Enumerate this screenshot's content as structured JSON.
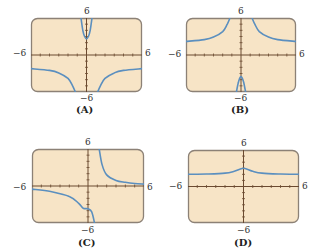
{
  "colors": {
    "panel_fill": "#f7e4c6",
    "panel_border": "#8c8176",
    "axis": "#6b4a30",
    "curve": "#5b8fbf"
  },
  "chart_data": [
    {
      "type": "line",
      "title": "(A)",
      "xlim": [
        -6,
        6
      ],
      "ylim": [
        -6,
        6
      ],
      "tick_labels": {
        "x_left": "-6",
        "x_right": "6",
        "y_top": "6",
        "y_bottom": "-6"
      },
      "description": "Vertical asymptotes near x=±1; middle branch opens upward with minimum near y≈2.5; outer branches approach y≈-2 from below and drop to -6 near asymptotes",
      "series": [
        {
          "name": "left-branch",
          "x": [
            -6,
            -4,
            -3,
            -2,
            -1.5,
            -1.2
          ],
          "y": [
            -2.2,
            -2.5,
            -2.9,
            -3.8,
            -5,
            -6
          ]
        },
        {
          "name": "middle-branch",
          "x": [
            -0.6,
            -0.4,
            -0.2,
            0,
            0.2,
            0.4,
            0.6
          ],
          "y": [
            6,
            4,
            3,
            2.6,
            3,
            4,
            6
          ]
        },
        {
          "name": "right-branch",
          "x": [
            1.2,
            1.5,
            2,
            3,
            4,
            6
          ],
          "y": [
            -6,
            -5,
            -3.8,
            -2.9,
            -2.5,
            -2.2
          ]
        }
      ]
    },
    {
      "type": "line",
      "title": "(B)",
      "xlim": [
        -6,
        6
      ],
      "ylim": [
        -6,
        6
      ],
      "tick_labels": {
        "x_left": "-6",
        "x_right": "6",
        "y_top": "6",
        "y_bottom": "-6"
      },
      "description": "Vertical asymptotes near x=±1; outer branches approach y≈2 from above rising to +6 near asymptotes; middle branch opens downward with max near y≈-3.5",
      "series": [
        {
          "name": "left-branch",
          "x": [
            -6,
            -4,
            -3,
            -2,
            -1.5,
            -1.2
          ],
          "y": [
            2.2,
            2.5,
            2.9,
            3.8,
            5,
            6
          ]
        },
        {
          "name": "middle-branch",
          "x": [
            -0.5,
            -0.3,
            -0.15,
            0,
            0.15,
            0.3,
            0.5
          ],
          "y": [
            -6,
            -4.5,
            -3.8,
            -3.5,
            -3.8,
            -4.5,
            -6
          ]
        },
        {
          "name": "right-branch",
          "x": [
            1.2,
            1.5,
            2,
            3,
            4,
            6
          ],
          "y": [
            6,
            5,
            3.8,
            2.9,
            2.5,
            2.2
          ]
        }
      ]
    },
    {
      "type": "line",
      "title": "(C)",
      "xlim": [
        -6,
        6
      ],
      "ylim": [
        -6,
        6
      ],
      "tick_labels": {
        "x_left": "-6",
        "x_right": "6",
        "y_top": "6",
        "y_bottom": "-6"
      },
      "description": "Single vertical asymptote near x≈1; left branch decreases from y≈-0.5 with a shoulder near y≈-3.8 then drops to -6; right branch decreases from +6 toward y≈0.3",
      "series": [
        {
          "name": "left-branch",
          "x": [
            -6,
            -4,
            -2,
            -1,
            -0.5,
            0,
            0.4,
            0.7
          ],
          "y": [
            -0.5,
            -0.9,
            -1.7,
            -2.8,
            -3.6,
            -3.7,
            -4.2,
            -6
          ]
        },
        {
          "name": "right-branch",
          "x": [
            1.2,
            1.5,
            2,
            3,
            4,
            5,
            6
          ],
          "y": [
            6,
            3.5,
            1.8,
            0.9,
            0.6,
            0.4,
            0.3
          ]
        }
      ]
    },
    {
      "type": "line",
      "title": "(D)",
      "xlim": [
        -6,
        6
      ],
      "ylim": [
        -6,
        6
      ],
      "tick_labels": {
        "x_left": "-6",
        "x_right": "6",
        "y_top": "6",
        "y_bottom": "-6"
      },
      "description": "Continuous curve with no asymptotes; horizontal asymptote near y≈2, cusp-like peak at x=0 with y≈3",
      "series": [
        {
          "name": "curve",
          "x": [
            -6,
            -4,
            -2,
            -1,
            0,
            1,
            2,
            4,
            6
          ],
          "y": [
            2,
            2.05,
            2.2,
            2.5,
            3,
            2.5,
            2.2,
            2.05,
            2
          ]
        }
      ]
    }
  ]
}
